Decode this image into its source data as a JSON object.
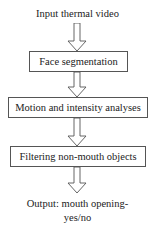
{
  "diagram": {
    "type": "flowchart",
    "input": "Input thermal video",
    "steps": [
      {
        "label": "Face segmentation"
      },
      {
        "label": "Motion and intensity analyses"
      },
      {
        "label": "Filtering non-mouth objects"
      }
    ],
    "output_line1": "Output: mouth opening-",
    "output_line2": "yes/no",
    "colors": {
      "border": "#555555",
      "arrow": "#555555",
      "text": "#222222",
      "background": "#ffffff"
    }
  }
}
